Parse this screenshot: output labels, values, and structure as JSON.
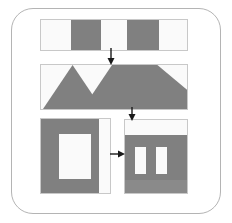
{
  "figure": {
    "title": "",
    "background": "#ffffff",
    "frame": {
      "name": "rounded-border-frame",
      "stroke": "#b4b4b4",
      "radius": 22
    },
    "palette": {
      "gray": "#808080",
      "white": "#fafafa",
      "outline": "#c8c8c8",
      "arrow": "#1a1a1a",
      "frame_stroke": "#b4b4b4"
    },
    "panels": [
      {
        "id": "panel-strip",
        "name": "striped-bar-panel",
        "x": 40,
        "y": 19,
        "w": 148,
        "h": 32,
        "kind": "vertical-stripes",
        "segments": [
          {
            "label": "stripe-1",
            "fill": "white",
            "x": 0,
            "w": 30
          },
          {
            "label": "stripe-2",
            "fill": "gray",
            "x": 30,
            "w": 30
          },
          {
            "label": "stripe-3",
            "fill": "white",
            "x": 60,
            "w": 26
          },
          {
            "label": "stripe-4",
            "fill": "gray",
            "x": 86,
            "w": 32
          },
          {
            "label": "stripe-5",
            "fill": "white",
            "x": 118,
            "w": 30
          }
        ]
      },
      {
        "id": "panel-triangles",
        "name": "triangles-panel",
        "x": 40,
        "y": 64,
        "w": 148,
        "h": 46,
        "kind": "triangles",
        "polygons": [
          {
            "label": "left-triangle",
            "fill": "gray",
            "points": "2,45 32,2 62,45"
          },
          {
            "label": "big-parallelogram",
            "fill": "gray",
            "points": "72,2 146,2 146,45 42,45"
          },
          {
            "label": "right-corner-triangle",
            "fill": "white",
            "points": "118,2 146,2 146,26"
          }
        ]
      },
      {
        "id": "panel-frame-block",
        "name": "framed-window-panel",
        "x": 40,
        "y": 118,
        "w": 71,
        "h": 76,
        "kind": "framed-window",
        "base_fill": "gray",
        "parts": [
          {
            "label": "inner-white-window",
            "fill": "white",
            "x": 18,
            "y": 15,
            "w": 32,
            "h": 45
          },
          {
            "label": "right-white-column",
            "fill": "white",
            "x": 58,
            "y": 0,
            "w": 13,
            "h": 76
          }
        ]
      },
      {
        "id": "panel-banded-block",
        "name": "banded-columns-panel",
        "x": 124,
        "y": 119,
        "w": 64,
        "h": 75,
        "kind": "banded-columns",
        "base_fill": "gray",
        "parts": [
          {
            "label": "top-white-band",
            "fill": "white",
            "x": 0,
            "y": 0,
            "w": 64,
            "h": 15
          },
          {
            "label": "column-1",
            "fill": "white",
            "x": 10,
            "y": 27,
            "w": 11,
            "h": 27
          },
          {
            "label": "column-2",
            "fill": "white",
            "x": 31,
            "y": 27,
            "w": 11,
            "h": 27
          },
          {
            "label": "bottom-gray-band",
            "fill": "gray",
            "x": 0,
            "y": 60,
            "w": 64,
            "h": 15
          }
        ]
      }
    ],
    "arrows": [
      {
        "id": "arrow-1",
        "name": "arrow-down-strip-to-triangles",
        "dir": "down",
        "x": 110,
        "y": 51,
        "len": 13
      },
      {
        "id": "arrow-2",
        "name": "arrow-down-triangles-to-block",
        "dir": "down",
        "x": 131,
        "y": 110,
        "len": 8
      },
      {
        "id": "arrow-3",
        "name": "arrow-right-block-to-block",
        "dir": "right",
        "x": 112,
        "y": 153,
        "len": 12
      }
    ]
  }
}
